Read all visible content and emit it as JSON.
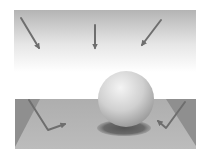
{
  "diagram": {
    "colors": {
      "background": "#ffffff",
      "sky_top": "#b4b4b4",
      "sky_bottom": "#ffffff",
      "floor": "#b2b2b2",
      "floor_dark": "#8e8e8e",
      "arrow": "#6e6e6e",
      "sphere_light": "#f2f2f2",
      "sphere_dark": "#9a9a9a",
      "shadow": "#5e5e5e"
    },
    "incoming_rays": [
      {
        "name": "left",
        "from": [
          21,
          18
        ],
        "to": [
          40,
          50
        ]
      },
      {
        "name": "center",
        "from": [
          95,
          25
        ],
        "to": [
          95,
          50
        ]
      },
      {
        "name": "right",
        "from": [
          161,
          20
        ],
        "to": [
          141,
          47
        ]
      }
    ],
    "reflected_rays": [
      {
        "name": "left",
        "points": [
          [
            29,
            100
          ],
          [
            48,
            130
          ],
          [
            67,
            123
          ]
        ]
      },
      {
        "name": "right",
        "points": [
          [
            185,
            102
          ],
          [
            166,
            128
          ],
          [
            157,
            120
          ]
        ]
      }
    ],
    "sphere": {
      "cx": 126,
      "cy": 99,
      "r": 28
    },
    "shadow": {
      "cx": 124,
      "cy": 128,
      "rx": 27,
      "ry": 8
    },
    "floor": {
      "x": 15,
      "y": 99,
      "width": 181,
      "height": 50
    }
  }
}
